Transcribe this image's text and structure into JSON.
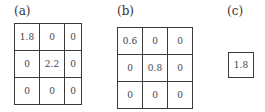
{
  "panels": [
    {
      "label": "(a)",
      "matrix": [
        [
          "1.8",
          "0",
          "0"
        ],
        [
          "0",
          "2.2",
          "0"
        ],
        [
          "0",
          "0",
          "0"
        ]
      ]
    },
    {
      "label": "(b)",
      "matrix": [
        [
          "0.6",
          "0",
          "0"
        ],
        [
          "0",
          "0.8",
          "0"
        ],
        [
          "0",
          "0",
          "0"
        ]
      ]
    },
    {
      "label": "(c)",
      "matrix": [
        [
          "1.8"
        ]
      ]
    }
  ]
}
